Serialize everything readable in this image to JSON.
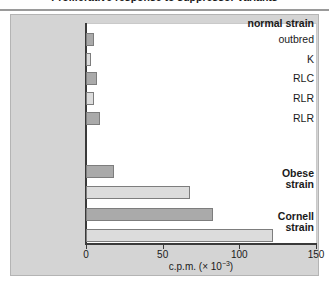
{
  "title": "Proliferative response to suppressor variants",
  "axis": {
    "xlabel_main": "c.p.m. (",
    "xlabel_mult": "× 10",
    "xlabel_exp": "−3",
    "xlabel_close": ")",
    "ticks": [
      "0",
      "50",
      "100",
      "150"
    ],
    "tick_values": [
      0,
      50,
      100,
      150
    ],
    "xmin": 0,
    "xmax": 150
  },
  "groups": [
    {
      "id": "group-normal-strain",
      "label": "normal strain"
    },
    {
      "id": "group-obese-strain",
      "label_line1": "Obese",
      "label_line2": "strain"
    },
    {
      "id": "group-cornell-strain",
      "label_line1": "Cornell",
      "label_line2": "strain"
    }
  ],
  "rows": [
    {
      "label": "outbred",
      "value": 5,
      "shade": "dark"
    },
    {
      "label": "K",
      "value": 3,
      "shade": "light"
    },
    {
      "label": "RLC",
      "value": 7,
      "shade": "dark"
    },
    {
      "label": "RLR",
      "value": 5,
      "shade": "light"
    },
    {
      "label": "RLR",
      "value": 9,
      "shade": "dark"
    },
    {
      "label": "",
      "value": 18,
      "shade": "dark"
    },
    {
      "label": "",
      "value": 68,
      "shade": "light"
    },
    {
      "label": "",
      "value": 83,
      "shade": "dark"
    },
    {
      "label": "",
      "value": 122,
      "shade": "light"
    }
  ],
  "colors": {
    "dark_bar": "#aaaaaa",
    "light_bar": "#dcdcdc",
    "bar_border": "#7d7d7d",
    "panel": "#d4d4d4",
    "axis": "#3a3a3a",
    "plot_bg": "#ffffff"
  },
  "chart_data": {
    "type": "bar",
    "orientation": "horizontal",
    "title": "Proliferative response to suppressor variants",
    "xlabel": "c.p.m. (× 10−3)",
    "ylabel": "",
    "xlim": [
      0,
      150
    ],
    "xticks": [
      0,
      50,
      100,
      150
    ],
    "grid": false,
    "legend": "none",
    "categories": [
      "normal strain: outbred",
      "normal strain: K",
      "normal strain: RLC",
      "normal strain: RLR",
      "normal strain: RLR",
      "Obese strain (dark)",
      "Obese strain (light)",
      "Cornell strain (dark)",
      "Cornell strain (light)"
    ],
    "values": [
      5,
      3,
      7,
      5,
      9,
      18,
      68,
      83,
      122
    ],
    "shades": [
      "dark",
      "light",
      "dark",
      "light",
      "dark",
      "dark",
      "light",
      "dark",
      "light"
    ],
    "groups": [
      "normal strain",
      "Obese strain",
      "Cornell strain"
    ]
  }
}
